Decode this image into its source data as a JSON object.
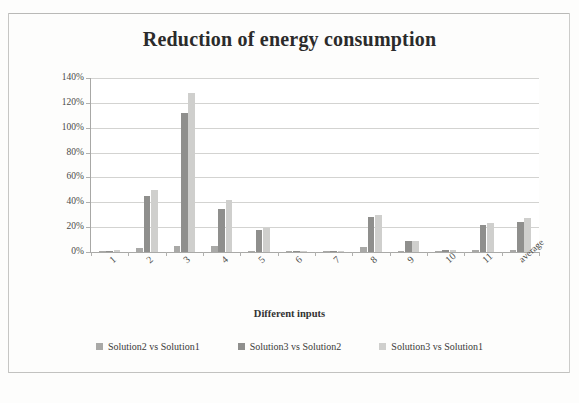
{
  "chart_data": {
    "type": "bar",
    "title": "Reduction of energy consumption",
    "xlabel": "Different inputs",
    "ylabel": "Percentage of reduction",
    "categories": [
      "1",
      "2",
      "3",
      "4",
      "5",
      "6",
      "7",
      "8",
      "9",
      "10",
      "11",
      "average"
    ],
    "series": [
      {
        "name": "Solution2 vs Solution1",
        "color": "#a9a9a7",
        "values": [
          1,
          3,
          5,
          5,
          1,
          1,
          1,
          4,
          1,
          1,
          2,
          2
        ]
      },
      {
        "name": "Solution3 vs Solution2",
        "color": "#8f8f8d",
        "values": [
          1,
          45,
          112,
          35,
          18,
          1,
          1,
          28,
          9,
          2,
          22,
          24
        ]
      },
      {
        "name": "Solution3 vs Solution1",
        "color": "#cfcfcd",
        "values": [
          2,
          50,
          128,
          42,
          19,
          1,
          1,
          30,
          9,
          2,
          23,
          27
        ]
      }
    ],
    "ylim": [
      0,
      140
    ],
    "yticks": [
      "0%",
      "20%",
      "40%",
      "60%",
      "80%",
      "100%",
      "120%",
      "140%"
    ],
    "ytick_values": [
      0,
      20,
      40,
      60,
      80,
      100,
      120,
      140
    ],
    "grid": true,
    "legend_position": "bottom"
  }
}
